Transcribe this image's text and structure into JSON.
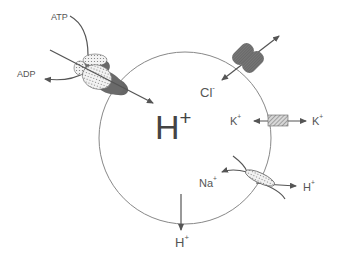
{
  "diagram": {
    "type": "vesicle ion transport",
    "center_label": {
      "base": "H",
      "sup": "+"
    },
    "atpase": {
      "in_label": "ATP",
      "out_label": "ADP"
    },
    "chloride_channel": {
      "label": {
        "base": "Cl",
        "sup": "-"
      }
    },
    "potassium_channel": {
      "left": {
        "base": "K",
        "sup": "+"
      },
      "right": {
        "base": "K",
        "sup": "+"
      }
    },
    "na_h_exchanger": {
      "na": {
        "base": "Na",
        "sup": "+"
      },
      "h": {
        "base": "H",
        "sup": "+"
      }
    },
    "proton_leak": {
      "label": {
        "base": "H",
        "sup": "+"
      }
    },
    "colors": {
      "membrane": "#777777",
      "protein_dark": "#666666",
      "arrow": "#555555",
      "text": "#555555"
    }
  }
}
